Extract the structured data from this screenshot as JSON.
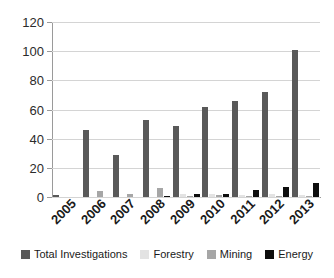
{
  "chart_data": {
    "type": "bar",
    "title": "",
    "subtitle": "",
    "xlabel": "",
    "ylabel": "",
    "ylim": [
      0,
      120
    ],
    "ytick_step": 20,
    "yticks": [
      "0",
      "20",
      "40",
      "60",
      "80",
      "100",
      "120"
    ],
    "grid": true,
    "legend_position": "bottom",
    "categories": [
      "2005",
      "2006",
      "2007",
      "2008",
      "2009",
      "2010",
      "2011",
      "2012",
      "2013"
    ],
    "series": [
      {
        "name": "Total Investigations",
        "color": "#595959",
        "values": [
          1.5,
          46,
          29,
          53,
          49,
          62,
          66,
          72,
          101
        ]
      },
      {
        "name": "Forestry",
        "color": "#e3e3e3",
        "values": [
          0,
          0,
          0,
          0,
          2,
          2,
          1.5,
          2,
          1.5
        ]
      },
      {
        "name": "Mining",
        "color": "#a6a6a6",
        "values": [
          0,
          4,
          2,
          6.5,
          1,
          1.5,
          1,
          1,
          1
        ]
      },
      {
        "name": "Energy",
        "color": "#0d0d0d",
        "values": [
          0,
          0,
          0,
          0.5,
          2,
          2,
          5,
          7,
          9.5
        ]
      }
    ]
  },
  "legend": {
    "items": [
      {
        "label": "Total Investigations"
      },
      {
        "label": "Forestry"
      },
      {
        "label": "Mining"
      },
      {
        "label": "Energy"
      }
    ]
  }
}
